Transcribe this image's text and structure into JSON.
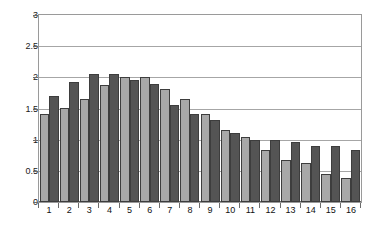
{
  "chart_data": {
    "type": "bar",
    "title": "",
    "subtitle": "",
    "xlabel": "",
    "ylabel": "",
    "ylim": [
      0,
      3
    ],
    "ytick_labels": [
      "0",
      "0.5",
      "1",
      "1.5",
      "2",
      "2.5",
      "3"
    ],
    "ytick_values": [
      0,
      0.5,
      1,
      1.5,
      2,
      2.5,
      3
    ],
    "grid": true,
    "legend": "none",
    "categories": [
      "1",
      "2",
      "3",
      "4",
      "5",
      "6",
      "7",
      "8",
      "9",
      "10",
      "11",
      "12",
      "13",
      "14",
      "15",
      "16"
    ],
    "series": [
      {
        "name": "series-1",
        "color": "#a8a8a8",
        "values": [
          1.42,
          1.51,
          1.66,
          1.87,
          2.0,
          2.0,
          1.81,
          1.65,
          1.41,
          1.16,
          1.04,
          0.84,
          0.68,
          0.63,
          0.45,
          0.38
        ]
      },
      {
        "name": "series-2",
        "color": "#545454",
        "values": [
          1.7,
          1.93,
          2.05,
          2.05,
          1.96,
          1.9,
          1.56,
          1.41,
          1.31,
          1.1,
          0.99,
          1.0,
          0.96,
          0.9,
          0.9,
          0.84
        ]
      }
    ]
  },
  "colors": {
    "series_light": "#a8a8a8",
    "series_dark": "#545454",
    "bar_border": "#3d3d3d",
    "gridline": "#a6a6a6",
    "axis": "#6b6b6b",
    "plot_border": "#9a9a9a",
    "background": "#ffffff",
    "text": "#111111"
  }
}
